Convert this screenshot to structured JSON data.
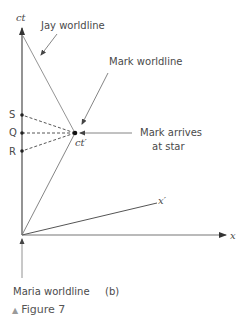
{
  "diagram": {
    "axes": {
      "ct_label": "ct",
      "x_label": "x",
      "x_prime_label": "x′"
    },
    "annotations": {
      "jay": "Jay worldline",
      "mark": "Mark worldline",
      "mark_arrives_line1": "Mark arrives",
      "mark_arrives_line2": "at star",
      "maria": "Maria worldline",
      "event_label": "ct′",
      "panel_label": "(b)"
    },
    "points": {
      "S": "S",
      "Q": "Q",
      "R": "R"
    },
    "caption": {
      "marker": "▲",
      "text": "Figure 7"
    },
    "colors": {
      "line": "#6e6e6e",
      "axis": "#555555",
      "text": "#4a4a4a"
    }
  }
}
